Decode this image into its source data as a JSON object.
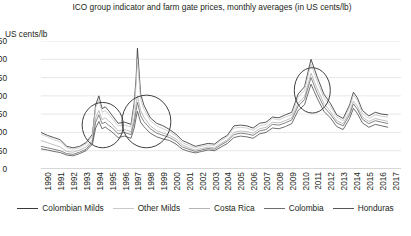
{
  "chart": {
    "title": "ICO group indicator and farm gate prices, monthly averages (in US cents/lb)",
    "ylabel": "US cents/lb"
  },
  "chart_data": {
    "type": "line",
    "title": "ICO group indicator and farm gate prices, monthly averages (in US cents/lb)",
    "xlabel": "",
    "ylabel": "US cents/lb",
    "ylim": [
      0,
      350
    ],
    "yticks": [
      0,
      50,
      100,
      150,
      200,
      250,
      300,
      350
    ],
    "xlim": [
      1990,
      2017
    ],
    "xticks": [
      "1990",
      "1991",
      "1992",
      "1993",
      "1994",
      "1995",
      "1996",
      "1997",
      "1998",
      "1999",
      "2000",
      "2001",
      "2002",
      "2003",
      "2004",
      "2005",
      "2006",
      "2007",
      "2008",
      "2009",
      "2010",
      "2011",
      "2012",
      "2013",
      "2014",
      "2015",
      "2016",
      "2017"
    ],
    "grid": true,
    "legend_position": "bottom",
    "annotations": [
      {
        "type": "ellipse",
        "label": "1994-95 price spike",
        "x_center": 1994.8,
        "y_center": 120,
        "x_radius": 1.6,
        "y_radius": 62
      },
      {
        "type": "ellipse",
        "label": "1997-99 price spike",
        "x_center": 1998.2,
        "y_center": 130,
        "x_radius": 1.9,
        "y_radius": 72
      },
      {
        "type": "ellipse",
        "label": "2011 price spike",
        "x_center": 2011.1,
        "y_center": 215,
        "x_radius": 1.4,
        "y_radius": 62
      }
    ],
    "x": [
      "1990",
      "1990.5",
      "1991",
      "1991.5",
      "1992",
      "1992.5",
      "1993",
      "1993.5",
      "1994",
      "1994.25",
      "1994.5",
      "1994.75",
      "1995",
      "1995.25",
      "1995.5",
      "1996",
      "1996.5",
      "1997",
      "1997.25",
      "1997.4",
      "1997.5",
      "1997.75",
      "1998",
      "1998.5",
      "1999",
      "1999.5",
      "2000",
      "2000.5",
      "2001",
      "2001.5",
      "2002",
      "2002.5",
      "2003",
      "2003.5",
      "2004",
      "2004.5",
      "2005",
      "2005.5",
      "2006",
      "2006.5",
      "2007",
      "2007.5",
      "2008",
      "2008.5",
      "2009",
      "2009.5",
      "2010",
      "2010.5",
      "2011",
      "2011.25",
      "2011.5",
      "2012",
      "2012.5",
      "2013",
      "2013.5",
      "2014",
      "2014.3",
      "2014.6",
      "2015",
      "2015.5",
      "2016",
      "2016.5",
      "2017"
    ],
    "series": [
      {
        "name": "Colombian Milds",
        "color": "#3a3a3a",
        "values": [
          100,
          92,
          86,
          80,
          62,
          58,
          62,
          72,
          95,
          175,
          200,
          165,
          170,
          160,
          148,
          125,
          128,
          122,
          180,
          250,
          330,
          205,
          175,
          140,
          125,
          118,
          108,
          95,
          78,
          70,
          62,
          66,
          70,
          68,
          82,
          92,
          118,
          120,
          118,
          112,
          125,
          128,
          142,
          140,
          148,
          155,
          205,
          225,
          300,
          275,
          250,
          205,
          180,
          148,
          138,
          175,
          210,
          195,
          160,
          145,
          155,
          150,
          148
        ]
      },
      {
        "name": "Other Milds",
        "color": "#c9c9c9",
        "values": [
          95,
          88,
          80,
          74,
          58,
          54,
          58,
          68,
          90,
          168,
          190,
          155,
          160,
          150,
          140,
          118,
          120,
          115,
          168,
          230,
          300,
          190,
          165,
          132,
          118,
          110,
          102,
          90,
          72,
          64,
          58,
          62,
          66,
          64,
          78,
          88,
          112,
          114,
          112,
          106,
          118,
          122,
          138,
          134,
          142,
          148,
          196,
          215,
          288,
          262,
          238,
          195,
          172,
          142,
          132,
          168,
          202,
          188,
          152,
          138,
          148,
          144,
          142
        ]
      },
      {
        "name": "Costa Rica",
        "color": "#b4b4b4",
        "values": [
          78,
          72,
          66,
          60,
          48,
          46,
          52,
          60,
          80,
          140,
          160,
          135,
          140,
          132,
          124,
          104,
          108,
          102,
          140,
          178,
          200,
          160,
          142,
          118,
          105,
          98,
          92,
          82,
          66,
          58,
          52,
          56,
          60,
          58,
          70,
          80,
          100,
          104,
          102,
          98,
          110,
          114,
          128,
          126,
          132,
          140,
          180,
          198,
          262,
          240,
          218,
          180,
          158,
          132,
          124,
          155,
          186,
          172,
          142,
          130,
          138,
          134,
          130
        ]
      },
      {
        "name": "Colombia",
        "color": "#6e6e6e",
        "values": [
          62,
          58,
          54,
          50,
          42,
          40,
          46,
          54,
          74,
          128,
          148,
          124,
          128,
          120,
          114,
          96,
          100,
          94,
          128,
          160,
          182,
          146,
          130,
          110,
          98,
          92,
          86,
          76,
          60,
          54,
          48,
          52,
          56,
          54,
          66,
          76,
          94,
          98,
          96,
          92,
          104,
          108,
          122,
          120,
          126,
          134,
          172,
          190,
          250,
          228,
          206,
          170,
          150,
          126,
          118,
          148,
          178,
          164,
          136,
          124,
          132,
          128,
          124
        ]
      },
      {
        "name": "Honduras",
        "color": "#555555",
        "values": [
          55,
          52,
          48,
          45,
          38,
          36,
          42,
          50,
          68,
          112,
          130,
          110,
          115,
          108,
          102,
          86,
          90,
          84,
          112,
          140,
          158,
          128,
          116,
          98,
          88,
          82,
          78,
          68,
          54,
          48,
          44,
          48,
          52,
          50,
          60,
          70,
          86,
          90,
          88,
          84,
          96,
          100,
          112,
          110,
          116,
          124,
          160,
          176,
          232,
          212,
          192,
          158,
          140,
          116,
          108,
          138,
          166,
          152,
          126,
          114,
          122,
          118,
          114
        ]
      }
    ]
  }
}
